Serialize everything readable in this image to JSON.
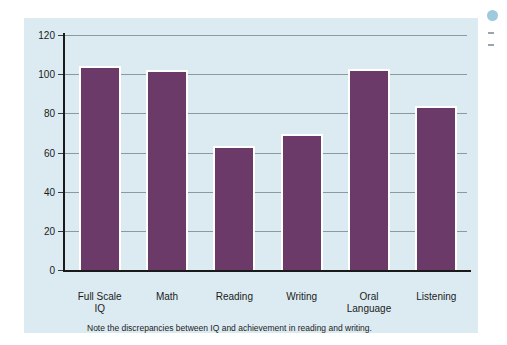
{
  "figure": {
    "caption": "Note the discrepancies between IQ and achievement in reading and writing.",
    "background_color": "#dcebf2",
    "bar_color": "#6b3a68",
    "gridline_color": "#8a9aa3",
    "axis_color": "#1a1a1a",
    "page_color": "#ffffff"
  },
  "chart_data": {
    "type": "bar",
    "title": "",
    "xlabel": "",
    "ylabel": "",
    "categories": [
      "Full Scale\nIQ",
      "Math",
      "Reading",
      "Writing",
      "Oral\nLanguage",
      "Listening"
    ],
    "category_lines": [
      [
        "Full Scale",
        "IQ"
      ],
      [
        "Math"
      ],
      [
        "Reading"
      ],
      [
        "Writing"
      ],
      [
        "Oral",
        "Language"
      ],
      [
        "Listening"
      ]
    ],
    "values": [
      104,
      102,
      63.5,
      69.5,
      102.5,
      83.5
    ],
    "ylim": [
      0,
      120
    ],
    "yticks": [
      0,
      20,
      40,
      60,
      80,
      100,
      120
    ],
    "ytick_labels": [
      "0",
      "20",
      "40",
      "60",
      "80",
      "100",
      "120"
    ],
    "grid": true,
    "grid_axis": "y",
    "legend": false,
    "annotations": [
      "Note the discrepancies between IQ and achievement in reading and writing."
    ]
  },
  "margin": {
    "bullet_color": "#8fc0d8"
  }
}
